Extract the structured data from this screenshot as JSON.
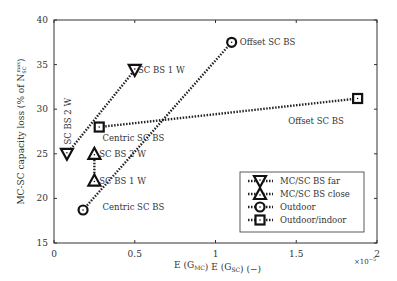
{
  "chart_data": {
    "type": "line",
    "title": "",
    "xlabel": "E (G_MC) E (G_SC) (−)",
    "xlabel_parts": [
      "E (G",
      "MC",
      ") E (G",
      "SC",
      ") (−)"
    ],
    "ylabel": "MC-SC capacity loss (% of N_SC^max)",
    "ylabel_parts": [
      "MC-SC capacity loss (% of N",
      "SC",
      "max",
      ")"
    ],
    "x_multiplier": "×10",
    "x_multiplier_exp": "−5",
    "xlim": [
      0,
      2
    ],
    "ylim": [
      15,
      40
    ],
    "xticks": [
      "0",
      "0.5",
      "1",
      "1.5",
      "2"
    ],
    "yticks": [
      "15",
      "20",
      "25",
      "30",
      "35",
      "40"
    ],
    "grid": false,
    "legend_position": "lower right (inside)",
    "series": [
      {
        "name": "MC/SC BS far",
        "marker": "triangle-down",
        "x": [
          0.08,
          0.5
        ],
        "y": [
          25,
          34.4
        ]
      },
      {
        "name": "MC/SC BS close",
        "marker": "triangle-up",
        "x": [
          0.25,
          0.25
        ],
        "y": [
          25,
          22
        ]
      },
      {
        "name": "Outdoor",
        "marker": "circle",
        "x": [
          0.18,
          1.1
        ],
        "y": [
          18.7,
          37.5
        ]
      },
      {
        "name": "Outdoor/indoor",
        "marker": "square",
        "x": [
          0.28,
          1.88
        ],
        "y": [
          28,
          31.2
        ]
      }
    ],
    "annotations": [
      {
        "text": "SC BS 1 W",
        "x": 0.52,
        "y": 34.4
      },
      {
        "text": "SC BS 2 W",
        "x": 0.03,
        "y": 29,
        "rotated": true
      },
      {
        "text": "SC BS 2 W",
        "x": 0.28,
        "y": 25
      },
      {
        "text": "SC BS 1 W",
        "x": 0.28,
        "y": 22
      },
      {
        "text": "Centric SC BS",
        "x": 0.3,
        "y": 26.8
      },
      {
        "text": "Centric SC BS",
        "x": 0.3,
        "y": 19
      },
      {
        "text": "Offset SC BS",
        "x": 1.15,
        "y": 37.5
      },
      {
        "text": "Offset SC BS",
        "x": 1.45,
        "y": 28.7
      }
    ]
  }
}
